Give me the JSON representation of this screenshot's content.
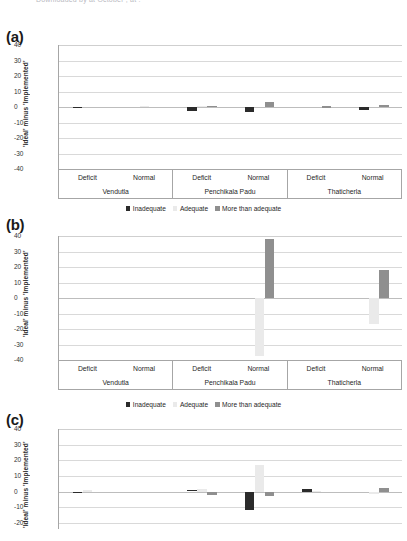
{
  "figure": {
    "top_caption_clipped": "Downloaded by  at  October  , at  :",
    "y_axis_label": "'Ideal' minus 'Implemented'",
    "legend": [
      {
        "label": "Inadequate",
        "color": "#2b2b2b",
        "key": "inadequate"
      },
      {
        "label": "Adequate",
        "color": "#eaeaea",
        "key": "adequate"
      },
      {
        "label": "More than adequate",
        "color": "#8f8f8f",
        "key": "more_than_adequate"
      }
    ],
    "panels": [
      {
        "tag": "(a)"
      },
      {
        "tag": "(b)"
      },
      {
        "tag": "(c)"
      }
    ],
    "groups": [
      {
        "name": "Vendutla",
        "subgroups": [
          "Deficit",
          "Normal"
        ]
      },
      {
        "name": "Penchikala Padu",
        "subgroups": [
          "Deficit",
          "Normal"
        ]
      },
      {
        "name": "Thaticherla",
        "subgroups": [
          "Deficit",
          "Normal"
        ]
      }
    ]
  },
  "chart_data": [
    {
      "id": "panel-a",
      "type": "bar",
      "title": "(a)",
      "xlabel": "",
      "ylabel": "'Ideal' minus 'Implemented'",
      "ylim": [
        -40,
        40
      ],
      "yticks": [
        40,
        30,
        20,
        10,
        0,
        -10,
        -20,
        -30,
        -40
      ],
      "grid": true,
      "legend_position": "below",
      "categories": [
        "Vendutla / Deficit",
        "Vendutla / Normal",
        "Penchikala Padu / Deficit",
        "Penchikala Padu / Normal",
        "Thaticherla / Deficit",
        "Thaticherla / Normal"
      ],
      "series": [
        {
          "name": "Inadequate",
          "color": "#2b2b2b",
          "values": [
            -0.8,
            0,
            -2.6,
            -3.2,
            0,
            -2.2
          ]
        },
        {
          "name": "Adequate",
          "color": "#eaeaea",
          "values": [
            0,
            0.5,
            0.6,
            0,
            0,
            0
          ]
        },
        {
          "name": "More than adequate",
          "color": "#8f8f8f",
          "values": [
            0,
            0,
            0.7,
            3.4,
            0.4,
            1.2
          ]
        }
      ]
    },
    {
      "id": "panel-b",
      "type": "bar",
      "title": "(b)",
      "xlabel": "",
      "ylabel": "'Ideal' minus 'Implemented'",
      "ylim": [
        -40,
        40
      ],
      "yticks": [
        40,
        30,
        20,
        10,
        0,
        -10,
        -20,
        -30,
        -40
      ],
      "grid": true,
      "legend_position": "above",
      "categories": [
        "Vendutla / Deficit",
        "Vendutla / Normal",
        "Penchikala Padu / Deficit",
        "Penchikala Padu / Normal",
        "Thaticherla / Deficit",
        "Thaticherla / Normal"
      ],
      "series": [
        {
          "name": "Inadequate",
          "color": "#2b2b2b",
          "values": [
            0,
            0,
            0,
            0,
            0,
            0
          ]
        },
        {
          "name": "Adequate",
          "color": "#eaeaea",
          "values": [
            0,
            0,
            0,
            -37.5,
            0,
            -16.5
          ]
        },
        {
          "name": "More than adequate",
          "color": "#8f8f8f",
          "values": [
            0,
            0,
            0,
            38.2,
            0,
            18.0
          ]
        }
      ]
    },
    {
      "id": "panel-c",
      "type": "bar",
      "title": "(c)",
      "xlabel": "",
      "ylabel": "'Ideal' minus 'Implemented'",
      "ylim": [
        -24,
        40
      ],
      "yticks": [
        40,
        30,
        20,
        10,
        0,
        -10,
        -20
      ],
      "grid": true,
      "legend_position": "above",
      "note": "panel is cropped at the bottom of the image",
      "categories": [
        "Vendutla / Deficit",
        "Vendutla / Normal",
        "Penchikala Padu / Deficit",
        "Penchikala Padu / Normal",
        "Thaticherla / Deficit",
        "Thaticherla / Normal"
      ],
      "series": [
        {
          "name": "Inadequate",
          "color": "#2b2b2b",
          "values": [
            -0.9,
            0,
            0.8,
            -12.0,
            1.4,
            0
          ]
        },
        {
          "name": "Adequate",
          "color": "#eaeaea",
          "values": [
            0.7,
            0,
            1.7,
            17.0,
            0.5,
            -1.5
          ]
        },
        {
          "name": "More than adequate",
          "color": "#8f8f8f",
          "values": [
            0,
            0,
            -2.2,
            -3.0,
            0,
            2.0
          ]
        }
      ]
    }
  ]
}
